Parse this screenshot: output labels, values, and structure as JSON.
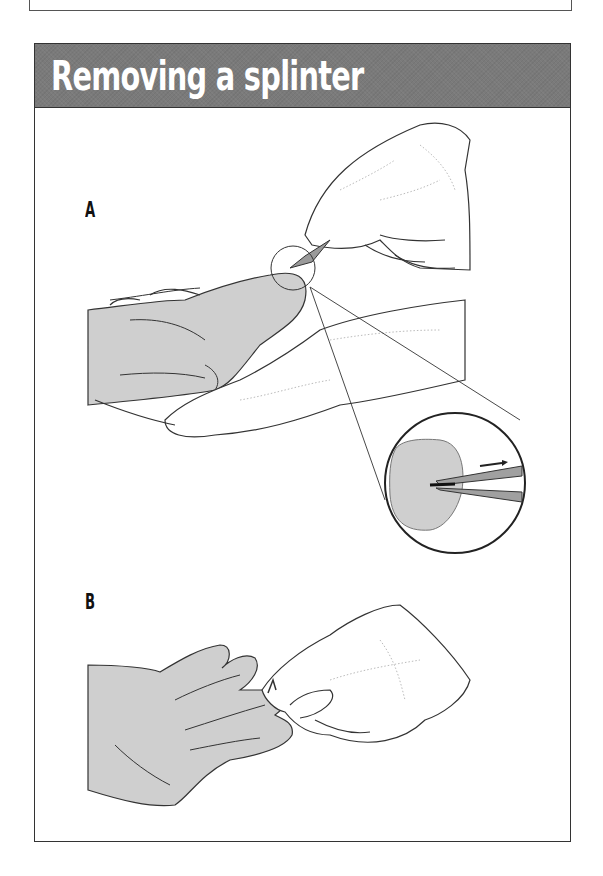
{
  "panel": {
    "title": "Removing a splinter",
    "header_color": "#7a7a7a",
    "title_color": "#ffffff"
  },
  "steps": [
    {
      "label": "A",
      "description_icon": "tweezers-grasping-splinter-with-magnified-detail"
    },
    {
      "label": "B",
      "description_icon": "squeezing-fingertip-after-removal"
    }
  ],
  "colors": {
    "skin_fill": "#cfcfcf",
    "outline": "#333333",
    "tweezers": "#9a9a9a"
  }
}
